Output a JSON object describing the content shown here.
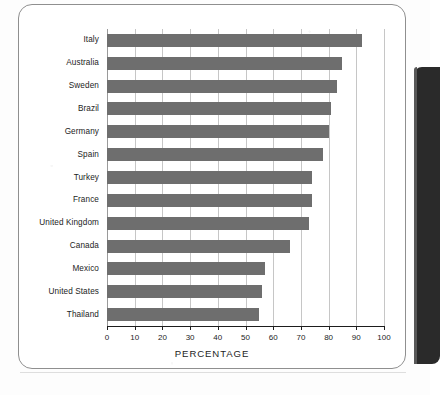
{
  "chart_data": {
    "type": "bar",
    "orientation": "horizontal",
    "title": "",
    "xlabel": "PERCENTAGE",
    "ylabel": "",
    "xlim": [
      0,
      100
    ],
    "xticks": [
      0,
      10,
      20,
      30,
      40,
      50,
      60,
      70,
      80,
      90,
      100
    ],
    "xtick_labels": [
      "0",
      "10",
      "20",
      "30",
      "40",
      "50",
      "60",
      "70",
      "80",
      "90",
      "100"
    ],
    "grid": true,
    "legend": false,
    "bar_color": "#6e6e6e",
    "categories": [
      "Italy",
      "Australia",
      "Sweden",
      "Brazil",
      "Germany",
      "Spain",
      "Turkey",
      "France",
      "United Kingdom",
      "Canada",
      "Mexico",
      "United States",
      "Thailand"
    ],
    "values": [
      92,
      85,
      83,
      81,
      80,
      78,
      74,
      74,
      73,
      66,
      57,
      56,
      55
    ]
  },
  "panel": {
    "right_edge_color": "#2a2a2a"
  }
}
